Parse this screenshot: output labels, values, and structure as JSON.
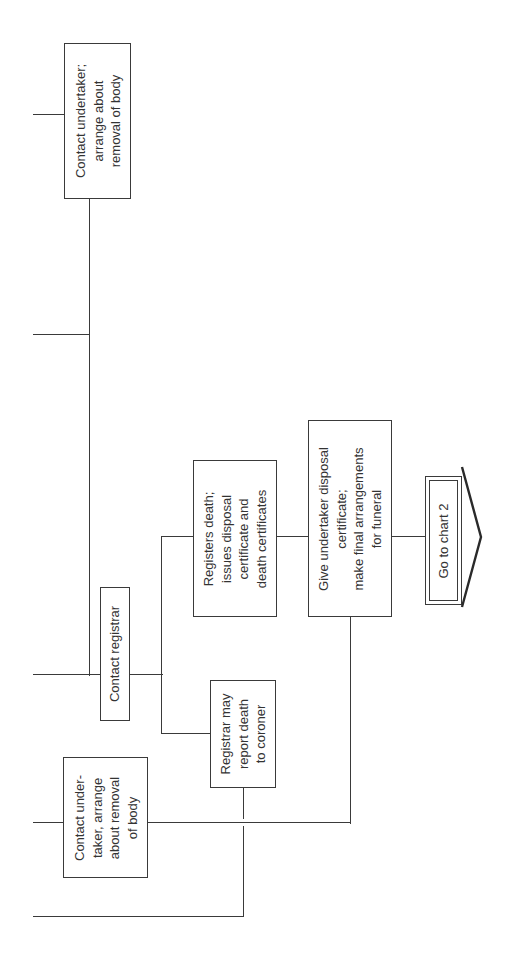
{
  "diagram": {
    "orientation": "rotated 90 degrees counter-clockwise",
    "line_color": "#3a3a3a",
    "nodes": [
      {
        "id": "n1",
        "lines": [
          "Contact undertaker;",
          "arrange about",
          "removal of body"
        ]
      },
      {
        "id": "n2",
        "lines": [
          "Contact registrar"
        ]
      },
      {
        "id": "n3",
        "lines": [
          "Registers death;",
          "issues disposal",
          "certificate and",
          "death certificates"
        ]
      },
      {
        "id": "n4",
        "lines": [
          "Give undertaker disposal",
          "certificate;",
          "make final arrangements",
          "for funeral"
        ]
      },
      {
        "id": "n5",
        "lines": [
          "Go to chart 2"
        ],
        "shape": "double-border-arrow"
      },
      {
        "id": "n6",
        "lines": [
          "Registrar may",
          "report death",
          "to coroner"
        ]
      },
      {
        "id": "n7",
        "lines": [
          "Contact under-",
          "taker, arrange",
          "about removal",
          "of body"
        ]
      }
    ],
    "edges": [
      {
        "from": "incoming-1",
        "to": "n1"
      },
      {
        "from": "n1",
        "to": "n2"
      },
      {
        "from": "incoming-2",
        "to": "n2"
      },
      {
        "from": "incoming-3",
        "to": "n2"
      },
      {
        "from": "n2",
        "to": "n3"
      },
      {
        "from": "n2",
        "to": "n6"
      },
      {
        "from": "n3",
        "to": "n4"
      },
      {
        "from": "n4",
        "to": "n5"
      },
      {
        "from": "incoming-4",
        "to": "n7"
      },
      {
        "from": "n7",
        "to": "n4"
      },
      {
        "from": "n6",
        "to": "incoming-5"
      }
    ]
  }
}
